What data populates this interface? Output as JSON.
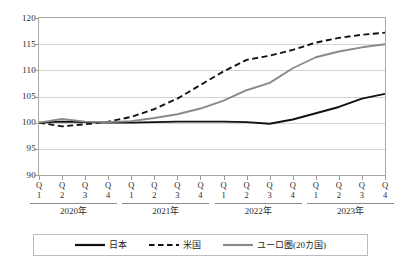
{
  "chart_data": {
    "type": "line",
    "title": "",
    "subtitle": "",
    "xlabel": "",
    "ylabel": "",
    "ylim": [
      90,
      120
    ],
    "yticks": [
      90,
      95,
      100,
      105,
      110,
      115,
      120
    ],
    "grid": true,
    "legend_position": "bottom",
    "x": [
      "Q1",
      "Q2",
      "Q3",
      "Q4",
      "Q1",
      "Q2",
      "Q3",
      "Q4",
      "Q1",
      "Q2",
      "Q3",
      "Q4",
      "Q1",
      "Q2",
      "Q3",
      "Q4"
    ],
    "x_groups": [
      {
        "label": "2020年",
        "start": 0,
        "end": 3
      },
      {
        "label": "2021年",
        "start": 4,
        "end": 7
      },
      {
        "label": "2022年",
        "start": 8,
        "end": 11
      },
      {
        "label": "2023年",
        "start": 12,
        "end": 15
      }
    ],
    "series": [
      {
        "name": "日本",
        "style": "solid",
        "color": "#111111",
        "width": 1.9,
        "values": [
          100.0,
          100.2,
          100.1,
          100.0,
          100.0,
          100.1,
          100.2,
          100.2,
          100.2,
          100.1,
          99.8,
          100.6,
          101.8,
          103.0,
          104.6,
          105.5
        ]
      },
      {
        "name": "米国",
        "style": "dashed",
        "color": "#111111",
        "width": 1.9,
        "values": [
          100.0,
          99.3,
          99.7,
          100.2,
          101.1,
          102.6,
          104.6,
          107.2,
          109.8,
          112.0,
          112.8,
          113.9,
          115.3,
          116.2,
          116.8,
          117.2
        ]
      },
      {
        "name": "ユーロ圏(20カ国)",
        "style": "solid",
        "color": "#8a8a8a",
        "width": 1.9,
        "values": [
          100.0,
          100.7,
          100.2,
          100.1,
          100.3,
          100.9,
          101.6,
          102.7,
          104.2,
          106.2,
          107.6,
          110.4,
          112.5,
          113.6,
          114.4,
          115.0
        ]
      }
    ]
  },
  "legend": {
    "items": [
      {
        "label": "日本",
        "icon": "solid-line-swatch"
      },
      {
        "label": "米国",
        "icon": "dashed-line-swatch"
      },
      {
        "label": "ユーロ圏(20カ国)",
        "icon": "solid-gray-line-swatch"
      }
    ]
  }
}
